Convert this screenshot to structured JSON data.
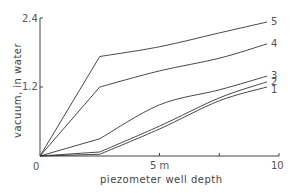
{
  "chart_data": {
    "type": "line",
    "title": "",
    "xlabel": "piezometer well depth",
    "ylabel": "vacuum, in water",
    "xlim": [
      0,
      10
    ],
    "ylim": [
      0,
      2.4
    ],
    "x_ticks": [
      {
        "value": 0,
        "label": "0"
      },
      {
        "value": 5,
        "label": "5 m"
      },
      {
        "value": 7.5,
        "label": ""
      },
      {
        "value": 10,
        "label": "10"
      }
    ],
    "y_ticks": [
      {
        "value": 1.2,
        "label": "1.2"
      },
      {
        "value": 2.4,
        "label": "2.4"
      }
    ],
    "grid": false,
    "legend": "inline labels at line ends",
    "x": [
      0,
      2.5,
      5,
      7.5,
      9.5
    ],
    "series": [
      {
        "name": "1",
        "values": [
          0,
          0.03,
          0.47,
          0.96,
          1.2
        ]
      },
      {
        "name": "2",
        "values": [
          0,
          0.07,
          0.52,
          1.01,
          1.29
        ]
      },
      {
        "name": "3",
        "values": [
          0,
          0.3,
          0.89,
          1.15,
          1.39
        ]
      },
      {
        "name": "4",
        "values": [
          0,
          1.2,
          1.48,
          1.7,
          1.95
        ]
      },
      {
        "name": "5",
        "values": [
          0,
          1.73,
          1.9,
          2.14,
          2.33
        ]
      }
    ]
  },
  "labels": {
    "origin": "0",
    "y_top": "2.4",
    "y_mid": "1.2",
    "x_mid": "5 m",
    "x_end": "10",
    "x_title": "piezometer well depth",
    "y_title": "vacuum, in water"
  }
}
